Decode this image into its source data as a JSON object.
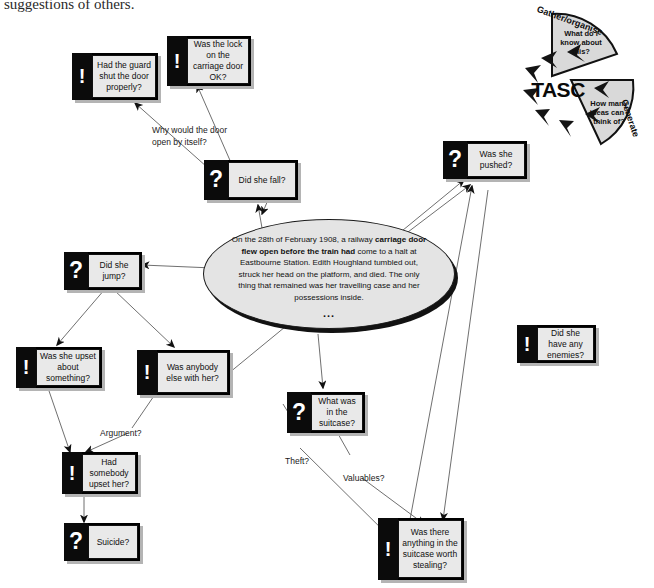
{
  "page": {
    "document_tail_line": "suggestions of others."
  },
  "story": {
    "name": "central-scenario-ellipse",
    "line1": "On the 28th of February 1908, a railway",
    "line2_bold": "carriage door flew open before the train had",
    "line3": "come to a halt at Eastbourne Station.   Edith",
    "line4": "Houghland tumbled out, struck her head on the",
    "line5": "platform, and died. The only thing that",
    "line6": "remained was her travelling case and her",
    "line7": "possessions inside.",
    "continuation": "..."
  },
  "nodes": [
    {
      "id": "guard-shut-door",
      "glyph": "!",
      "glyph_name": "exclamation-idea-icon",
      "text": "Had the guard shut the door properly?"
    },
    {
      "id": "lock-on-door",
      "glyph": "!",
      "glyph_name": "exclamation-idea-icon",
      "text": "Was the lock on the carriage door OK?"
    },
    {
      "id": "did-she-fall",
      "glyph": "?",
      "glyph_name": "question-mark-icon",
      "text": "Did she fall?"
    },
    {
      "id": "was-she-pushed",
      "glyph": "?",
      "glyph_name": "question-mark-icon",
      "text": "Was she pushed?"
    },
    {
      "id": "did-she-jump",
      "glyph": "?",
      "glyph_name": "question-mark-icon",
      "text": "Did she jump?"
    },
    {
      "id": "upset-about",
      "glyph": "!",
      "glyph_name": "exclamation-idea-icon",
      "text": "Was she upset about something?"
    },
    {
      "id": "anybody-else",
      "glyph": "!",
      "glyph_name": "exclamation-idea-icon",
      "text": "Was anybody else with her?"
    },
    {
      "id": "somebody-upset",
      "glyph": "!",
      "glyph_name": "exclamation-idea-icon",
      "text": "Had somebody upset her?"
    },
    {
      "id": "suicide",
      "glyph": "?",
      "glyph_name": "question-mark-icon",
      "text": "Suicide?"
    },
    {
      "id": "what-in-suitcase",
      "glyph": "?",
      "glyph_name": "question-mark-icon",
      "text": "What was in the suitcase?"
    },
    {
      "id": "have-enemies",
      "glyph": "!",
      "glyph_name": "exclamation-idea-icon",
      "text": "Did she have any enemies?"
    },
    {
      "id": "worth-stealing",
      "glyph": "!",
      "glyph_name": "exclamation-idea-icon",
      "text": "Was there anything in the suitcase worth stealing?"
    }
  ],
  "edge_labels": [
    {
      "id": "why-door-open",
      "text": "Why would the door\nopen by itself?"
    },
    {
      "id": "argument",
      "text": "Argument?"
    },
    {
      "id": "theft",
      "text": "Theft?"
    },
    {
      "id": "valuables",
      "text": "Valuables?"
    }
  ],
  "tasc": {
    "core": "TASC",
    "segment_gather_arc": "Gather/organise",
    "segment_gather_text": "What do I know about this?",
    "segment_generate_arc": "Generate",
    "segment_generate_text": "How many ideas can I think of?"
  },
  "colors": {
    "card_face": "#e9e9e9",
    "card_glyph_panel": "#0b0b0b",
    "card_shadow": "#b4b4b4",
    "ellipse_fill": "#e4e4e4",
    "ink": "#101010"
  }
}
